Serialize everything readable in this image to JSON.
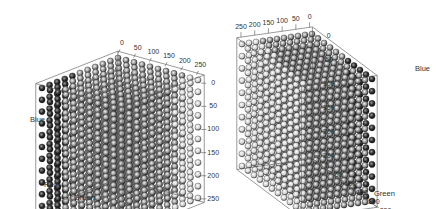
{
  "chart_data": [
    {
      "type": "scatter",
      "title": "",
      "subtitle": "RGB color cube rendered as 3D sphere scatter (grayscale), view 1",
      "axes": {
        "x": {
          "label": "Red",
          "ticks": [
            0,
            50,
            100,
            150,
            200,
            250
          ],
          "range": [
            0,
            255
          ]
        },
        "y": {
          "label": "Green",
          "ticks": [
            0,
            50,
            100,
            150,
            200,
            250
          ],
          "range": [
            0,
            255
          ]
        },
        "z": {
          "label": "Blue",
          "ticks": [
            0,
            50,
            100,
            150,
            200,
            250
          ],
          "range": [
            0,
            255
          ]
        }
      },
      "grid_step": 25,
      "points_per_axis": 11,
      "grid": false,
      "legend": null,
      "box": true
    },
    {
      "type": "scatter",
      "title": "",
      "subtitle": "RGB color cube rendered as 3D sphere scatter (grayscale), view 2",
      "axes": {
        "x": {
          "label": "Red",
          "ticks": [
            250,
            200,
            150,
            100,
            50,
            0
          ],
          "range": [
            0,
            255
          ]
        },
        "y": {
          "label": "Green",
          "ticks": [
            0,
            50,
            100,
            150,
            200,
            250
          ],
          "range": [
            0,
            255
          ]
        },
        "z": {
          "label": "Blue",
          "ticks": [
            0,
            50,
            100,
            150,
            200,
            250
          ],
          "range": [
            0,
            255
          ]
        }
      },
      "grid_step": 25,
      "points_per_axis": 11,
      "grid": false,
      "legend": null,
      "box": true
    }
  ],
  "left": {
    "top_ticks": [
      "0",
      "50",
      "100",
      "150",
      "200",
      "250"
    ],
    "right_ticks": [
      "0",
      "50",
      "100",
      "150",
      "200",
      "250"
    ],
    "bottom_ticks": [
      "0",
      "50",
      "100",
      "150",
      "200",
      "250"
    ],
    "label_blue": "Blue",
    "label_red": "Red",
    "label_green": "Green"
  },
  "right": {
    "top_ticks": [
      "250",
      "200",
      "150",
      "100",
      "50",
      "0"
    ],
    "right_ticks": [
      "0",
      "50",
      "100",
      "150",
      "200",
      "250"
    ],
    "bottom_ticks": [
      "0",
      "50",
      "100",
      "150",
      "200",
      "250"
    ],
    "label_blue": "Blue",
    "label_green": "Green"
  }
}
